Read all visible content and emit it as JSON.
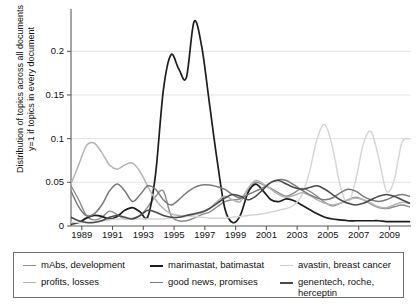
{
  "chart_data": {
    "type": "line",
    "title": "",
    "xlabel": "",
    "ylabel_line1": "Distribution of topics across all documents",
    "ylabel_line2": "y=1 if topics in every document",
    "xlim": [
      1988.3,
      2010.4
    ],
    "ylim": [
      0,
      0.245
    ],
    "grid": "horizontal",
    "legend_position": "below-plot",
    "xticks": [
      1989,
      1991,
      1993,
      1995,
      1997,
      1999,
      2001,
      2003,
      2005,
      2007,
      2009
    ],
    "xticklabels": [
      "1989",
      "1991",
      "1993",
      "1995",
      "1997",
      "1999",
      "2001",
      "2003",
      "2005",
      "2007",
      "2009"
    ],
    "yticks": [
      0,
      0.05,
      0.1,
      0.15,
      0.2
    ],
    "yticklabels": [
      "0",
      "0.05",
      "0.1",
      "0.15",
      "0.2"
    ],
    "x": [
      1988.3,
      1988.8,
      1989.3,
      1989.8,
      1990.3,
      1990.8,
      1991.3,
      1991.8,
      1992.3,
      1992.8,
      1993.3,
      1993.8,
      1994.3,
      1994.8,
      1995.3,
      1995.8,
      1996.3,
      1996.8,
      1997.3,
      1997.8,
      1998.3,
      1998.8,
      1999.3,
      1999.8,
      2000.3,
      2000.8,
      2001.3,
      2001.8,
      2002.3,
      2002.8,
      2003.3,
      2003.8,
      2004.3,
      2004.8,
      2005.3,
      2005.8,
      2006.3,
      2006.8,
      2007.3,
      2007.8,
      2008.3,
      2008.8,
      2009.3,
      2009.8,
      2010.3
    ],
    "series": [
      {
        "name": "mAbs, development",
        "color": "#8c8c8c",
        "width": 1.4,
        "values": [
          0.046,
          0.03,
          0.012,
          0.007,
          0.01,
          0.017,
          0.013,
          0.008,
          0.009,
          0.012,
          0.022,
          0.034,
          0.04,
          0.012,
          0.006,
          0.006,
          0.009,
          0.013,
          0.016,
          0.022,
          0.028,
          0.03,
          0.031,
          0.041,
          0.05,
          0.047,
          0.043,
          0.038,
          0.034,
          0.038,
          0.043,
          0.04,
          0.034,
          0.027,
          0.023,
          0.026,
          0.03,
          0.033,
          0.03,
          0.025,
          0.021,
          0.02,
          0.022,
          0.024,
          0.022
        ]
      },
      {
        "name": "marimastat, batimastat",
        "color": "#1d1d1d",
        "width": 1.7,
        "values": [
          0.002,
          0.004,
          0.009,
          0.012,
          0.011,
          0.008,
          0.011,
          0.018,
          0.021,
          0.016,
          0.011,
          0.06,
          0.155,
          0.196,
          0.18,
          0.17,
          0.234,
          0.205,
          0.14,
          0.075,
          0.02,
          0.004,
          0.012,
          0.038,
          0.048,
          0.04,
          0.03,
          0.028,
          0.031,
          0.029,
          0.024,
          0.019,
          0.014,
          0.01,
          0.008,
          0.007,
          0.006,
          0.006,
          0.006,
          0.006,
          0.006,
          0.005,
          0.005,
          0.005,
          0.005
        ]
      },
      {
        "name": "avastin, breast cancer",
        "color": "#d6d6d6",
        "width": 1.5,
        "values": [
          0.004,
          0.004,
          0.004,
          0.005,
          0.006,
          0.007,
          0.008,
          0.008,
          0.008,
          0.008,
          0.008,
          0.008,
          0.008,
          0.009,
          0.01,
          0.011,
          0.011,
          0.01,
          0.009,
          0.009,
          0.009,
          0.01,
          0.011,
          0.012,
          0.013,
          0.014,
          0.016,
          0.018,
          0.02,
          0.024,
          0.035,
          0.062,
          0.1,
          0.116,
          0.09,
          0.046,
          0.026,
          0.052,
          0.094,
          0.108,
          0.078,
          0.04,
          0.052,
          0.095,
          0.1
        ]
      },
      {
        "name": "profits, losses",
        "color": "#b4b4b4",
        "width": 1.5,
        "values": [
          0.048,
          0.07,
          0.092,
          0.095,
          0.084,
          0.07,
          0.065,
          0.07,
          0.072,
          0.062,
          0.045,
          0.03,
          0.02,
          0.014,
          0.012,
          0.012,
          0.013,
          0.015,
          0.02,
          0.028,
          0.034,
          0.03,
          0.028,
          0.043,
          0.052,
          0.048,
          0.042,
          0.036,
          0.033,
          0.035,
          0.038,
          0.035,
          0.03,
          0.026,
          0.024,
          0.026,
          0.03,
          0.032,
          0.03,
          0.026,
          0.022,
          0.021,
          0.024,
          0.027,
          0.026
        ]
      },
      {
        "name": "good news, promises",
        "color": "#7a7a7a",
        "width": 1.5,
        "values": [
          0.04,
          0.022,
          0.012,
          0.014,
          0.024,
          0.04,
          0.048,
          0.04,
          0.028,
          0.036,
          0.046,
          0.042,
          0.03,
          0.024,
          0.03,
          0.038,
          0.044,
          0.047,
          0.047,
          0.045,
          0.042,
          0.036,
          0.032,
          0.036,
          0.04,
          0.044,
          0.05,
          0.053,
          0.052,
          0.047,
          0.041,
          0.036,
          0.032,
          0.03,
          0.032,
          0.038,
          0.042,
          0.04,
          0.034,
          0.03,
          0.028,
          0.03,
          0.034,
          0.036,
          0.034
        ]
      },
      {
        "name": "genentech, roche, herceptin",
        "color": "#4a4a4a",
        "width": 1.6,
        "values": [
          0.01,
          0.006,
          0.004,
          0.004,
          0.006,
          0.01,
          0.012,
          0.01,
          0.008,
          0.012,
          0.018,
          0.016,
          0.012,
          0.01,
          0.01,
          0.012,
          0.014,
          0.016,
          0.02,
          0.026,
          0.032,
          0.036,
          0.034,
          0.03,
          0.034,
          0.042,
          0.05,
          0.052,
          0.048,
          0.044,
          0.042,
          0.044,
          0.046,
          0.042,
          0.036,
          0.03,
          0.026,
          0.024,
          0.026,
          0.03,
          0.034,
          0.036,
          0.034,
          0.03,
          0.026
        ]
      }
    ]
  },
  "legend": {
    "entries": [
      {
        "label": "mAbs, development",
        "color": "#8c8c8c",
        "width": "1.5px"
      },
      {
        "label": "marimastat, batimastat",
        "color": "#1d1d1d",
        "width": "2px"
      },
      {
        "label": "avastin, breast cancer",
        "color": "#cccccc",
        "width": "1.5px"
      },
      {
        "label": "profits, losses",
        "color": "#b4b4b4",
        "width": "1.5px"
      },
      {
        "label": "good news, promises",
        "color": "#7a7a7a",
        "width": "1.5px"
      },
      {
        "label": "genentech, roche,\nherceptin",
        "color": "#4a4a4a",
        "width": "2px"
      }
    ]
  },
  "axis": {
    "spine_color": "#5a5a5a",
    "grid_color": "#e2e2e2"
  }
}
